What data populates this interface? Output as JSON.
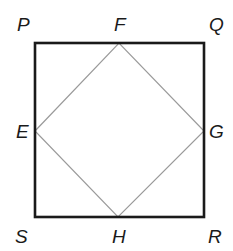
{
  "diagram": {
    "type": "geometry",
    "outer_square": {
      "name": "PQRS",
      "stroke_color": "#1a1a1a",
      "vertices": {
        "P": {
          "x": 35,
          "y": 43
        },
        "Q": {
          "x": 204,
          "y": 43
        },
        "R": {
          "x": 204,
          "y": 217
        },
        "S": {
          "x": 35,
          "y": 217
        }
      }
    },
    "inner_quadrilateral": {
      "name": "EFGH",
      "stroke_color": "#9a9a9a",
      "vertices": {
        "E": {
          "x": 35,
          "y": 131
        },
        "F": {
          "x": 119,
          "y": 43
        },
        "G": {
          "x": 204,
          "y": 131
        },
        "H": {
          "x": 118,
          "y": 217
        }
      }
    },
    "labels": {
      "P": "P",
      "Q": "Q",
      "R": "R",
      "S": "S",
      "E": "E",
      "F": "F",
      "G": "G",
      "H": "H"
    }
  }
}
